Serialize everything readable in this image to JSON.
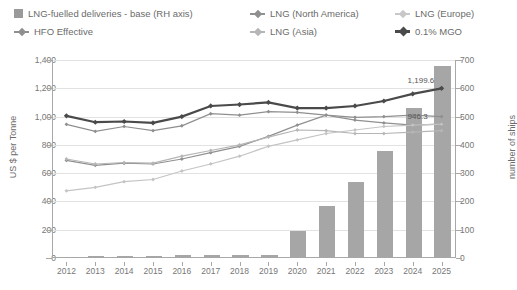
{
  "legend": {
    "items": [
      {
        "label": "LNG-fuelled deliveries - base (RH axis)",
        "marker": "bar-swatch",
        "color": "#9a9a9a"
      },
      {
        "label": "HFO Effective",
        "marker": "line-diamond",
        "color": "#8f8f8f"
      },
      {
        "label": "LNG (North America)",
        "marker": "line-diamond",
        "color": "#909090"
      },
      {
        "label": "LNG (Asia)",
        "marker": "line-diamond",
        "color": "#b6b6b6"
      },
      {
        "label": "LNG (Europe)",
        "marker": "line-diamond",
        "color": "#c4c4c4"
      },
      {
        "label": "0.1% MGO",
        "marker": "line-diamond",
        "color": "#4a4a4a"
      }
    ]
  },
  "axes": {
    "left_title": "US $ per Tonne",
    "right_title": "number of ships",
    "left_ticks": [
      "1,400",
      "1,200",
      "1,000",
      "800",
      "600",
      "400",
      "200",
      "0"
    ],
    "right_ticks": [
      "700",
      "600",
      "500",
      "400",
      "300",
      "200",
      "100",
      "0"
    ]
  },
  "chart_data": {
    "type": "line",
    "title": "",
    "xlabel": "",
    "ylabel": "US $ per Tonne",
    "y2label": "number of ships",
    "ylim": [
      0,
      1400
    ],
    "y2lim": [
      0,
      700
    ],
    "grid": true,
    "legend_position": "top",
    "categories": [
      "2012",
      "2013",
      "2014",
      "2015",
      "2016",
      "2017",
      "2018",
      "2019",
      "2020",
      "2021",
      "2022",
      "2023",
      "2024",
      "2025"
    ],
    "bars": {
      "name": "LNG-fuelled deliveries - base (RH axis)",
      "axis": "right",
      "color": "#a6a6a6",
      "values": [
        4,
        6,
        7,
        8,
        9,
        10,
        11,
        12,
        95,
        185,
        270,
        380,
        530,
        680
      ]
    },
    "series": [
      {
        "name": "0.1% MGO",
        "axis": "left",
        "color": "#4a4a4a",
        "values": [
          1005,
          960,
          965,
          955,
          1000,
          1075,
          1085,
          1100,
          1060,
          1060,
          1075,
          1110,
          1160,
          1199.6
        ]
      },
      {
        "name": "HFO Effective",
        "axis": "left",
        "color": "#8f8f8f",
        "values": [
          945,
          895,
          930,
          900,
          935,
          1020,
          1010,
          1035,
          1030,
          1010,
          995,
          1000,
          1010,
          1000
        ]
      },
      {
        "name": "LNG (North America)",
        "axis": "left",
        "color": "#909090",
        "values": [
          690,
          655,
          670,
          665,
          700,
          745,
          790,
          860,
          940,
          1010,
          975,
          955,
          940,
          946.3
        ]
      },
      {
        "name": "LNG (Asia)",
        "axis": "left",
        "color": "#b6b6b6",
        "values": [
          700,
          665,
          675,
          670,
          720,
          760,
          800,
          855,
          905,
          900,
          880,
          880,
          890,
          900
        ]
      },
      {
        "name": "LNG (Europe)",
        "axis": "left",
        "color": "#c4c4c4",
        "values": [
          475,
          500,
          540,
          555,
          615,
          665,
          720,
          790,
          835,
          880,
          905,
          930,
          940,
          946.3
        ]
      }
    ],
    "data_labels": [
      {
        "text": "1,199.6",
        "series": "0.1% MGO",
        "category": "2025"
      },
      {
        "text": "946.3",
        "series": "LNG (North America)",
        "category": "2025"
      }
    ]
  }
}
